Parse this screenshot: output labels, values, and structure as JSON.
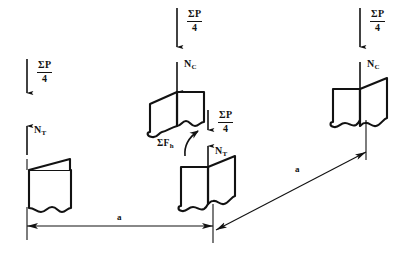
{
  "diagram": {
    "stroke_color": "#121212",
    "background_color": "#ffffff",
    "labels": {
      "load_numerator": "ΣP",
      "load_denominator": "4",
      "compression_symbol": "N",
      "compression_subscript": "C",
      "tension_symbol": "N",
      "tension_subscript": "T",
      "horizontal_force": "ΣF",
      "horizontal_force_subscript": "h",
      "dimension": "a"
    },
    "forces": [
      {
        "id": "left-load",
        "label_num": "ΣP",
        "label_den": "4",
        "direction": "down",
        "x": 33,
        "y": 62
      },
      {
        "id": "left-reaction",
        "label": "N",
        "subscript": "T",
        "direction": "up",
        "x": 33,
        "y": 130
      },
      {
        "id": "middle-load",
        "label_num": "ΣP",
        "label_den": "4",
        "direction": "down",
        "x": 177,
        "y": 12
      },
      {
        "id": "middle-compression",
        "label": "N",
        "subscript": "C",
        "direction": "down",
        "x": 177,
        "y": 60
      },
      {
        "id": "middle-lower-load",
        "label_num": "ΣP",
        "label_den": "4",
        "direction": "down",
        "x": 212,
        "y": 114
      },
      {
        "id": "middle-lower-reaction",
        "label": "N",
        "subscript": "T",
        "direction": "up",
        "x": 212,
        "y": 150
      },
      {
        "id": "shear-force",
        "label": "ΣF",
        "subscript": "h",
        "direction": "curved",
        "x": 160,
        "y": 140
      },
      {
        "id": "right-load",
        "label_num": "ΣP",
        "label_den": "4",
        "direction": "down",
        "x": 360,
        "y": 12
      },
      {
        "id": "right-compression",
        "label": "N",
        "subscript": "C",
        "direction": "down",
        "x": 360,
        "y": 60
      }
    ],
    "dimensions": [
      {
        "id": "horizontal-span",
        "label": "a",
        "orientation": "horizontal",
        "x1": 27,
        "y1": 225,
        "x2": 213,
        "y2": 225
      },
      {
        "id": "diagonal-span",
        "label": "a",
        "orientation": "diagonal",
        "x1": 216,
        "y1": 228,
        "x2": 364,
        "y2": 152
      }
    ],
    "blocks": [
      {
        "id": "left-block",
        "type": "flat-with-flap"
      },
      {
        "id": "middle-upper-block",
        "type": "skewed-prism"
      },
      {
        "id": "middle-lower-block",
        "type": "skewed-prism"
      },
      {
        "id": "right-block",
        "type": "skewed-prism"
      }
    ]
  }
}
